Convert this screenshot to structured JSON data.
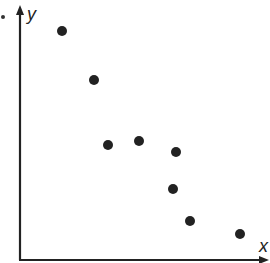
{
  "chart_data": {
    "type": "scatter",
    "title": "",
    "xlabel": "x",
    "ylabel": "y",
    "grid": false,
    "legend": null,
    "points_px": [
      [
        62,
        31
      ],
      [
        94,
        80
      ],
      [
        108,
        145
      ],
      [
        139,
        141
      ],
      [
        176,
        152
      ],
      [
        173,
        189
      ],
      [
        190,
        221
      ],
      [
        240,
        234
      ]
    ],
    "points_relative": [
      {
        "x": 0.17,
        "y": 0.9
      },
      {
        "x": 0.3,
        "y": 0.7
      },
      {
        "x": 0.36,
        "y": 0.44
      },
      {
        "x": 0.49,
        "y": 0.46
      },
      {
        "x": 0.64,
        "y": 0.41
      },
      {
        "x": 0.63,
        "y": 0.26
      },
      {
        "x": 0.7,
        "y": 0.13
      },
      {
        "x": 0.9,
        "y": 0.08
      }
    ],
    "trend": "negative correlation"
  },
  "axes": {
    "x_label": "x",
    "y_label": "y"
  },
  "style": {
    "ink": "#222222",
    "background": "#ffffff"
  }
}
